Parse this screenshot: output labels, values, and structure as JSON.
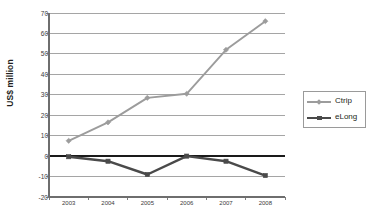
{
  "chart_data": {
    "type": "line",
    "title": "",
    "xlabel": "",
    "ylabel": "US$ million",
    "categories": [
      "2003",
      "2004",
      "2005",
      "2006",
      "2007",
      "2008"
    ],
    "ylim": [
      -20,
      70
    ],
    "ytick_values": [
      70,
      60,
      50,
      40,
      30,
      20,
      10,
      0,
      -10,
      -20
    ],
    "ytick_labels": [
      "70",
      "60",
      "50",
      "40",
      "30",
      "20",
      "10",
      "0",
      "-10",
      "-20"
    ],
    "grid": true,
    "grid_axis": "y",
    "legend_position": "right",
    "series": [
      {
        "name": "Ctrip",
        "color": "#9c9c9c",
        "marker": "diamond",
        "values": [
          7.5,
          16.5,
          28.5,
          30.5,
          52.0,
          66.0
        ]
      },
      {
        "name": "eLong",
        "color": "#4a4a4a",
        "marker": "square",
        "values": [
          -0.3,
          -2.5,
          -9.0,
          0.0,
          -2.5,
          -9.5
        ]
      }
    ],
    "zero_line": 0,
    "colors": {
      "ctrip": "#9c9c9c",
      "elong": "#4a4a4a",
      "grid": "#8f8f8f",
      "axis": "#6e6e6e",
      "zero": "#1a1a1a",
      "text": "#231f20",
      "background": "#ffffff"
    }
  },
  "legend": {
    "items": [
      {
        "label": "Ctrip"
      },
      {
        "label": "eLong"
      }
    ]
  }
}
